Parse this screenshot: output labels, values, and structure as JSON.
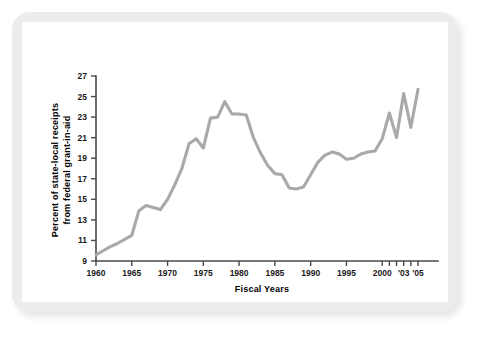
{
  "chart_data": {
    "type": "line",
    "title": "",
    "xlabel": "Fiscal Years",
    "ylabel": "Percent of state-local receipts from federal grant-in-aid",
    "ylabel_line1": "Percent of state-local receipts",
    "ylabel_line2": "from federal grant-in-aid",
    "xlim": [
      1960,
      2005
    ],
    "ylim": [
      9,
      27
    ],
    "grid": false,
    "legend": "none",
    "line_color": "#a9a9a9",
    "axis_color": "#4a4a4a",
    "ytick_labels": [
      "27",
      "25",
      "23",
      "21",
      "19",
      "17",
      "15",
      "13",
      "11",
      "9"
    ],
    "ytick_values": [
      27,
      25,
      23,
      21,
      19,
      17,
      15,
      13,
      11,
      9
    ],
    "xtick_labels": [
      "1960",
      "1965",
      "1970",
      "1975",
      "1980",
      "1985",
      "1990",
      "1995",
      "2000",
      "'03",
      "'05"
    ],
    "xtick_label_values": [
      1960,
      1965,
      1970,
      1975,
      1980,
      1985,
      1990,
      1995,
      2000,
      2003,
      2005
    ],
    "xtick_values": [
      1960,
      1965,
      1970,
      1975,
      1980,
      1985,
      1990,
      1995,
      2000,
      2001,
      2002,
      2003,
      2004,
      2005
    ],
    "x": [
      1960,
      1961,
      1962,
      1963,
      1964,
      1965,
      1966,
      1967,
      1968,
      1969,
      1970,
      1971,
      1972,
      1973,
      1974,
      1975,
      1976,
      1977,
      1978,
      1979,
      1980,
      1981,
      1982,
      1983,
      1984,
      1985,
      1986,
      1987,
      1988,
      1989,
      1990,
      1991,
      1992,
      1993,
      1994,
      1995,
      1996,
      1997,
      1998,
      1999,
      2000,
      2001,
      2002,
      2003,
      2004,
      2005
    ],
    "values": [
      9.6,
      10.0,
      10.4,
      10.7,
      11.1,
      11.5,
      13.9,
      14.4,
      14.2,
      14.0,
      15.0,
      16.4,
      18.0,
      20.4,
      20.9,
      20.0,
      22.9,
      23.0,
      24.5,
      23.3,
      23.3,
      23.2,
      21.0,
      19.5,
      18.3,
      17.5,
      17.4,
      16.1,
      16.0,
      16.2,
      17.4,
      18.6,
      19.3,
      19.6,
      19.4,
      18.9,
      19.0,
      19.4,
      19.6,
      19.7,
      20.9,
      23.4,
      21.0,
      25.3,
      22.0,
      25.7
    ],
    "series": [
      {
        "name": "Percent of state-local receipts from federal grant-in-aid",
        "color": "#a9a9a9"
      }
    ]
  }
}
